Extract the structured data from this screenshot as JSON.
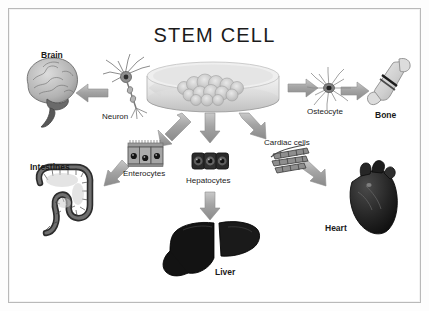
{
  "figure": {
    "title": "STEM CELL",
    "background_color": "#ffffff",
    "border_color": "#b9b9b9",
    "palette": {
      "ink": "#1a1a1a",
      "arrow_fill": "#a9a9a9",
      "arrow_edge": "#8d8d8d",
      "dish_fill": "#dcdcdc",
      "organ_dark": "#111111",
      "organ_mid": "#9a9a9a"
    }
  },
  "source_node": {
    "name": "stem-cell-culture-dish",
    "label": "",
    "description": "petri dish with stem cell colony"
  },
  "nodes": [
    {
      "id": "neuron",
      "label": "Neuron",
      "emphasis": "normal",
      "kind": "cell",
      "icon": "neuron-icon"
    },
    {
      "id": "brain",
      "label": "Brain",
      "emphasis": "bold",
      "kind": "organ",
      "icon": "brain-icon"
    },
    {
      "id": "osteocyte",
      "label": "Osteocyte",
      "emphasis": "normal",
      "kind": "cell",
      "icon": "osteocyte-icon"
    },
    {
      "id": "bone",
      "label": "Bone",
      "emphasis": "bold",
      "kind": "organ",
      "icon": "bone-icon"
    },
    {
      "id": "enterocytes",
      "label": "Enterocytes",
      "emphasis": "normal",
      "kind": "cell",
      "icon": "enterocytes-icon"
    },
    {
      "id": "intestines",
      "label": "Intestines",
      "emphasis": "bold",
      "kind": "organ",
      "icon": "intestines-icon"
    },
    {
      "id": "hepatocytes",
      "label": "Hepatocytes",
      "emphasis": "normal",
      "kind": "cell",
      "icon": "hepatocytes-icon"
    },
    {
      "id": "liver",
      "label": "Liver",
      "emphasis": "bold",
      "kind": "organ",
      "icon": "liver-icon"
    },
    {
      "id": "cardiac_cells",
      "label": "Cardiac cells",
      "emphasis": "normal",
      "kind": "cell",
      "icon": "cardiac-cells-icon"
    },
    {
      "id": "heart",
      "label": "Heart",
      "emphasis": "bold",
      "kind": "organ",
      "icon": "heart-icon"
    }
  ],
  "edges": [
    {
      "from": "stem_cell",
      "to": "neuron",
      "direction": "left"
    },
    {
      "from": "neuron",
      "to": "brain",
      "direction": "left"
    },
    {
      "from": "stem_cell",
      "to": "osteocyte",
      "direction": "right"
    },
    {
      "from": "osteocyte",
      "to": "bone",
      "direction": "right"
    },
    {
      "from": "stem_cell",
      "to": "enterocytes",
      "direction": "down-left"
    },
    {
      "from": "enterocytes",
      "to": "intestines",
      "direction": "down-left"
    },
    {
      "from": "stem_cell",
      "to": "hepatocytes",
      "direction": "down"
    },
    {
      "from": "hepatocytes",
      "to": "liver",
      "direction": "down"
    },
    {
      "from": "stem_cell",
      "to": "cardiac_cells",
      "direction": "down-right"
    },
    {
      "from": "cardiac_cells",
      "to": "heart",
      "direction": "down-right"
    }
  ]
}
